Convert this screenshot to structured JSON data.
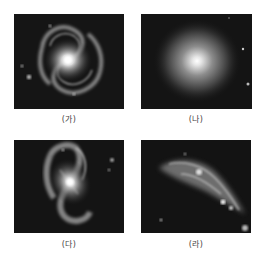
{
  "figure": {
    "panels": [
      {
        "label": "(가)",
        "type": "spiral galaxy (face-on, grand design)"
      },
      {
        "label": "(나)",
        "type": "elliptical galaxy"
      },
      {
        "label": "(다)",
        "type": "barred spiral galaxy"
      },
      {
        "label": "(라)",
        "type": "irregular galaxy"
      }
    ]
  }
}
